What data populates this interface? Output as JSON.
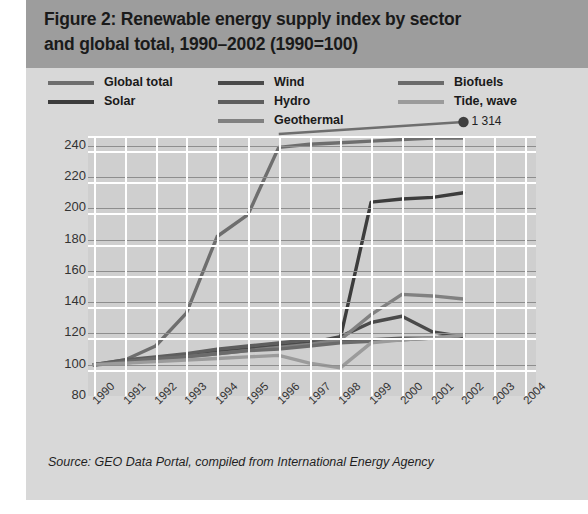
{
  "figure": {
    "title_line1": "Figure 2: Renewable energy supply index by sector",
    "title_line2": "and global total, 1990–2002 (1990=100)",
    "source": "Source: GEO Data Portal, compiled from International Energy Agency"
  },
  "legend": {
    "items": [
      {
        "label": "Global total",
        "color": "#6e6e6e"
      },
      {
        "label": "Solar",
        "color": "#3c3c3c"
      },
      {
        "label": "Wind",
        "color": "#4a4a4a"
      },
      {
        "label": "Hydro",
        "color": "#5e5e5e"
      },
      {
        "label": "Geothermal",
        "color": "#818181"
      },
      {
        "label": "Biofuels",
        "color": "#6b6b6b"
      },
      {
        "label": "Tide, wave",
        "color": "#9b9b9b"
      }
    ]
  },
  "annotations": [
    {
      "text": "1 314",
      "series": "Global total",
      "x": "2002",
      "y_value": 1314
    }
  ],
  "chart_data": {
    "type": "line",
    "title": "Figure 2: Renewable energy supply index by sector and global total, 1990–2002 (1990=100)",
    "xlabel": "",
    "ylabel": "",
    "ylim": [
      80,
      245
    ],
    "yticks": [
      80,
      100,
      120,
      140,
      160,
      180,
      200,
      220,
      240
    ],
    "grid": true,
    "legend_position": "top",
    "x": [
      "1990",
      "1991",
      "1992",
      "1993",
      "1994",
      "1995",
      "1996",
      "1997",
      "1998",
      "1999",
      "2000",
      "2001",
      "2002",
      "2003",
      "2004"
    ],
    "categories": [
      "1990",
      "1991",
      "1992",
      "1993",
      "1994",
      "1995",
      "1996",
      "1997",
      "1998",
      "1999",
      "2000",
      "2001",
      "2002"
    ],
    "note": "Global total series is clipped at the top of the axis; its 2002 endpoint is labelled 1 314.",
    "series": [
      {
        "name": "Global total",
        "color": "#6e6e6e",
        "values": [
          100,
          103,
          112,
          133,
          182,
          196,
          239,
          241,
          242,
          243,
          244,
          245,
          246
        ]
      },
      {
        "name": "Solar",
        "color": "#3c3c3c",
        "values": [
          100,
          102,
          104,
          106,
          108,
          110,
          112,
          114,
          117,
          204,
          206,
          207,
          210
        ]
      },
      {
        "name": "Wind",
        "color": "#4a4a4a",
        "values": [
          100,
          102,
          104,
          106,
          108,
          110,
          112,
          114,
          118,
          127,
          131,
          121,
          118
        ]
      },
      {
        "name": "Hydro",
        "color": "#5e5e5e",
        "values": [
          100,
          103,
          105,
          107,
          110,
          112,
          114,
          116,
          116,
          116,
          117,
          117,
          119
        ]
      },
      {
        "name": "Geothermal",
        "color": "#818181",
        "values": [
          100,
          101,
          103,
          105,
          107,
          109,
          111,
          113,
          116,
          132,
          145,
          144,
          142
        ]
      },
      {
        "name": "Biofuels",
        "color": "#6b6b6b",
        "values": [
          100,
          102,
          104,
          105,
          107,
          109,
          110,
          112,
          114,
          115,
          116,
          117,
          119
        ]
      },
      {
        "name": "Tide, wave",
        "color": "#9b9b9b",
        "values": [
          100,
          101,
          102,
          103,
          104,
          105,
          106,
          101,
          98,
          114,
          116,
          117,
          119
        ]
      }
    ]
  }
}
